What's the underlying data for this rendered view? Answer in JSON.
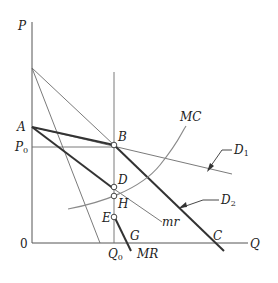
{
  "diagram": {
    "type": "kinked-demand / price-discrimination economics diagram",
    "axes": {
      "y_label": "P",
      "x_label": "Q",
      "origin_label": "0"
    },
    "points": {
      "A": "A",
      "P0": "P",
      "P0_sub": "0",
      "B": "B",
      "D": "D",
      "H": "H",
      "E": "E",
      "G": "G",
      "C": "C",
      "Q0": "Q",
      "Q0_sub": "0"
    },
    "curves": {
      "MC": "MC",
      "D1": "D",
      "D1_sub": "1",
      "D2": "D",
      "D2_sub": "2",
      "mr": "mr",
      "MR": "MR"
    },
    "colors": {
      "axis": "#555555",
      "thick_line": "#333333",
      "thin_line": "#6b6b6b",
      "mc_curve": "#8a8a8a"
    }
  }
}
